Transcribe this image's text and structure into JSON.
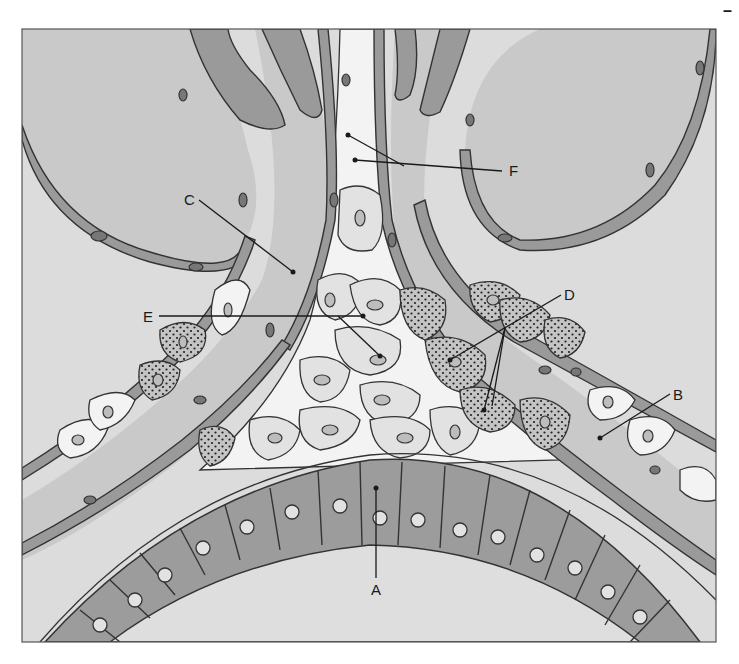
{
  "figure": {
    "colors": {
      "background": "#ffffff",
      "frame_border": "#555555",
      "alveolar_space": "#dcdcdc",
      "capillary_lumen": "#c9c9c9",
      "endothelium": "#9a9a9a",
      "epithelium": "#9c9c9c",
      "interstitial_cells": "#e2e2e2",
      "label_text": "#1a1a1a"
    },
    "corner_mark": "–"
  },
  "labels": [
    {
      "id": "A",
      "text": "A",
      "x": 376,
      "y": 593,
      "pointer": [
        [
          376,
          578
        ],
        [
          376,
          488
        ]
      ]
    },
    {
      "id": "B",
      "text": "B",
      "x": 676,
      "y": 400,
      "pointer": [
        [
          670,
          394
        ],
        [
          600,
          438
        ]
      ]
    },
    {
      "id": "C",
      "text": "C",
      "x": 184,
      "y": 205,
      "pointer": [
        [
          199,
          201
        ],
        [
          293,
          272
        ]
      ]
    },
    {
      "id": "D",
      "text": "D",
      "x": 564,
      "y": 300,
      "pointer": [
        [
          561,
          295
        ],
        [
          450,
          360
        ]
      ],
      "pointer2": [
        [
          561,
          295
        ],
        [
          492,
          406
        ]
      ],
      "pointer3": [
        [
          505,
          335
        ],
        [
          484,
          410
        ]
      ]
    },
    {
      "id": "E",
      "text": "E",
      "x": 142,
      "y": 322,
      "pointer": [
        [
          159,
          316
        ],
        [
          363,
          316
        ]
      ],
      "pointer2": [
        [
          338,
          316
        ],
        [
          380,
          356
        ]
      ]
    },
    {
      "id": "F",
      "text": "F",
      "x": 509,
      "y": 176,
      "pointer": [
        [
          502,
          171
        ],
        [
          355,
          158
        ]
      ],
      "pointer2": [
        [
          404,
          166
        ],
        [
          348,
          135
        ]
      ]
    }
  ]
}
